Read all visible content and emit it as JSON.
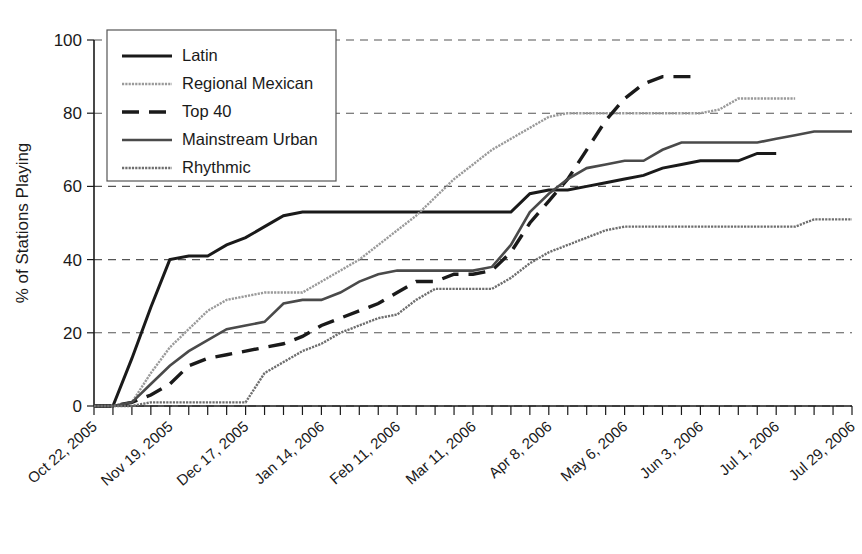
{
  "chart_data": {
    "type": "line",
    "title": "",
    "xlabel": "",
    "ylabel": "% of Stations Playing",
    "ylim": [
      0,
      100
    ],
    "yticks": [
      0,
      20,
      40,
      60,
      80,
      100
    ],
    "grid": true,
    "legend_position": "top-left",
    "x_tick_labels": [
      "Oct 22, 2005",
      "Nov 19, 2005",
      "Dec 17, 2005",
      "Jan 14, 2006",
      "Feb 11, 2006",
      "Mar 11, 2006",
      "Apr 8, 2006",
      "May 6, 2006",
      "Jun 3, 2006",
      "Jul 1, 2006",
      "Jul 29, 2006"
    ],
    "x_tick_label_interval_weeks": 4,
    "x_total_weeks": 41,
    "x_start": "Oct 22, 2005",
    "x_end": "Jul 29, 2006",
    "series": [
      {
        "name": "Latin",
        "style": "solid-thick",
        "color": "#1a1a1a",
        "width": 3.0,
        "values": [
          0,
          0,
          13,
          27,
          40,
          41,
          41,
          44,
          46,
          49,
          52,
          53,
          53,
          53,
          53,
          53,
          53,
          53,
          53,
          53,
          53,
          53,
          53,
          58,
          59,
          59,
          60,
          61,
          62,
          63,
          65,
          66,
          67,
          67,
          67,
          69,
          69,
          null,
          null,
          null,
          null
        ]
      },
      {
        "name": "Regional Mexican",
        "style": "dotted-light",
        "color": "#9a9a9a",
        "width": 2.4,
        "values": [
          0,
          0,
          1,
          9,
          16,
          21,
          26,
          29,
          30,
          31,
          31,
          31,
          34,
          37,
          40,
          44,
          48,
          52,
          57,
          62,
          66,
          70,
          73,
          76,
          79,
          80,
          80,
          80,
          80,
          80,
          80,
          80,
          80,
          81,
          84,
          84,
          84,
          84,
          null,
          null,
          null
        ]
      },
      {
        "name": "Top 40",
        "style": "dashed",
        "color": "#1a1a1a",
        "width": 3.4,
        "values": [
          0,
          0,
          1,
          3,
          6,
          11,
          13,
          14,
          15,
          16,
          17,
          19,
          22,
          24,
          26,
          28,
          31,
          34,
          34,
          36,
          36,
          37,
          42,
          50,
          56,
          62,
          70,
          78,
          84,
          88,
          90,
          90,
          90,
          null,
          null,
          null,
          null,
          null,
          null,
          null,
          null
        ]
      },
      {
        "name": "Mainstream Urban",
        "style": "solid-medium",
        "color": "#4a4a4a",
        "width": 2.6,
        "values": [
          0,
          0,
          1,
          6,
          11,
          15,
          18,
          21,
          22,
          23,
          28,
          29,
          29,
          31,
          34,
          36,
          37,
          37,
          37,
          37,
          37,
          38,
          44,
          53,
          58,
          62,
          65,
          66,
          67,
          67,
          70,
          72,
          72,
          72,
          72,
          72,
          73,
          74,
          75,
          75,
          75
        ]
      },
      {
        "name": "Rhythmic",
        "style": "dotted-medium",
        "color": "#6e6e6e",
        "width": 2.4,
        "values": [
          0,
          0,
          0,
          1,
          1,
          1,
          1,
          1,
          1,
          9,
          12,
          15,
          17,
          20,
          22,
          24,
          25,
          29,
          32,
          32,
          32,
          32,
          35,
          39,
          42,
          44,
          46,
          48,
          49,
          49,
          49,
          49,
          49,
          49,
          49,
          49,
          49,
          49,
          51,
          51,
          51
        ]
      }
    ]
  },
  "legend": {
    "entries": [
      {
        "label": "Latin"
      },
      {
        "label": "Regional Mexican"
      },
      {
        "label": "Top 40"
      },
      {
        "label": "Mainstream Urban"
      },
      {
        "label": "Rhythmic"
      }
    ]
  },
  "axes": {
    "y_title": "% of Stations Playing"
  }
}
